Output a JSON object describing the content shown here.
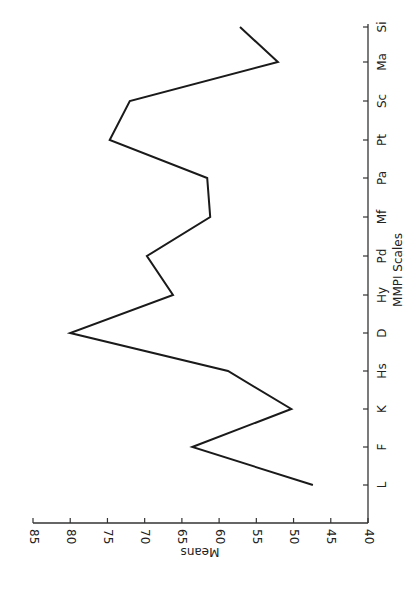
{
  "chart_data": {
    "type": "line",
    "orientation": "rotated 90° clockwise (category axis on right, value axis on bottom)",
    "title": "",
    "xlabel": "MMPI Scales",
    "ylabel": "Means",
    "categories": [
      "L",
      "F",
      "K",
      "Hs",
      "D",
      "Hy",
      "Pd",
      "Mf",
      "Pa",
      "Pt",
      "Sc",
      "Ma",
      "Si"
    ],
    "series": [
      {
        "name": "Means",
        "values": [
          47.4,
          63.6,
          50.3,
          58.8,
          80.0,
          66.2,
          69.7,
          61.2,
          61.6,
          74.7,
          72.0,
          52.1,
          57.2
        ]
      }
    ],
    "ylim": [
      40,
      85
    ],
    "yticks": [
      40,
      45,
      50,
      55,
      60,
      65,
      70,
      75,
      80,
      85
    ],
    "grid": false,
    "legend": null
  },
  "layout": {
    "value_axis": {
      "x_at_min": 368,
      "x_at_max": 33,
      "y": 523
    },
    "category_axis": {
      "x": 368,
      "y_top": 24,
      "y_bottom": 523
    },
    "category_y": [
      485,
      447,
      409,
      371,
      333,
      295,
      256,
      217,
      178,
      140,
      101,
      62,
      27
    ],
    "line_color": "#1a1a1a"
  }
}
